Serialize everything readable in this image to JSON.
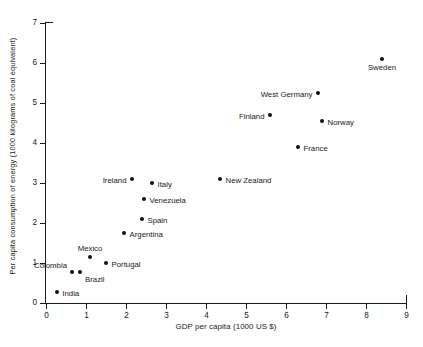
{
  "chart_data": {
    "type": "scatter",
    "title": "",
    "xlabel": "GDP per capita (1000 US $)",
    "ylabel": "Per capita consumption of energy (1000 kilograms of coal equivalent)",
    "xlim": [
      0,
      9
    ],
    "ylim": [
      0,
      7
    ],
    "xticks": [
      "0",
      "1",
      "2",
      "3",
      "4",
      "5",
      "6",
      "7",
      "8",
      "9"
    ],
    "yticks": [
      "0",
      "1",
      "2",
      "3",
      "4",
      "5",
      "6",
      "7"
    ],
    "grid": false,
    "legend": "none",
    "marker_color": "#111111",
    "axis_color": "#1a1a1a",
    "background": "#ffffff",
    "points": [
      {
        "label": "Sweden",
        "x": 8.4,
        "y": 6.1,
        "label_pos": "below"
      },
      {
        "label": "West Germany",
        "x": 6.8,
        "y": 5.25,
        "label_pos": "left"
      },
      {
        "label": "Finland",
        "x": 5.6,
        "y": 4.7,
        "label_pos": "left"
      },
      {
        "label": "Norway",
        "x": 6.9,
        "y": 4.55,
        "label_pos": "right"
      },
      {
        "label": "France",
        "x": 6.3,
        "y": 3.9,
        "label_pos": "right"
      },
      {
        "label": "Ireland",
        "x": 2.15,
        "y": 3.1,
        "label_pos": "left"
      },
      {
        "label": "New Zealand",
        "x": 4.35,
        "y": 3.1,
        "label_pos": "right"
      },
      {
        "label": "Italy",
        "x": 2.65,
        "y": 3.0,
        "label_pos": "right"
      },
      {
        "label": "Venezuela",
        "x": 2.45,
        "y": 2.6,
        "label_pos": "right"
      },
      {
        "label": "Spain",
        "x": 2.4,
        "y": 2.1,
        "label_pos": "right"
      },
      {
        "label": "Argentina",
        "x": 1.95,
        "y": 1.75,
        "label_pos": "right"
      },
      {
        "label": "Mexico",
        "x": 1.1,
        "y": 1.15,
        "label_pos": "above"
      },
      {
        "label": "Portugal",
        "x": 1.5,
        "y": 1.0,
        "label_pos": "right"
      },
      {
        "label": "Colombia",
        "x": 0.65,
        "y": 0.77,
        "label_pos": "colombia"
      },
      {
        "label": "Brazil",
        "x": 0.85,
        "y": 0.77,
        "label_pos": "brazil"
      },
      {
        "label": "India",
        "x": 0.27,
        "y": 0.27,
        "label_pos": "right"
      }
    ]
  }
}
